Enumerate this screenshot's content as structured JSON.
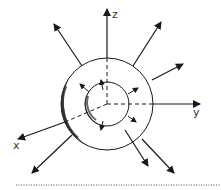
{
  "diagram": {
    "axes": {
      "z_label": "z",
      "x_label": "x",
      "y_label": "y"
    },
    "colors": {
      "stroke": "#1a1a1a",
      "shading": "#2a2a2a",
      "background": "#ffffff",
      "separator": "#555555"
    },
    "center": [
      107,
      104
    ],
    "outer_radius": 46,
    "inner_radius": 22,
    "outer_arrows": [
      {
        "from": [
          82,
          66
        ],
        "to": [
          54,
          24
        ]
      },
      {
        "from": [
          133,
          66
        ],
        "to": [
          161,
          22
        ]
      },
      {
        "from": [
          152,
          80
        ],
        "to": [
          183,
          64
        ]
      },
      {
        "from": [
          72,
          135
        ],
        "to": [
          32,
          173
        ]
      },
      {
        "from": [
          125,
          130
        ],
        "to": [
          148,
          166
        ]
      },
      {
        "from": [
          142,
          139
        ],
        "to": [
          174,
          173
        ]
      }
    ],
    "inner_arrows": [
      {
        "from": [
          89,
          92
        ],
        "to": [
          80,
          84
        ]
      },
      {
        "from": [
          103,
          90
        ],
        "to": [
          101,
          80
        ]
      },
      {
        "from": [
          128,
          94
        ],
        "to": [
          138,
          88
        ]
      },
      {
        "from": [
          128,
          116
        ],
        "to": [
          136,
          122
        ]
      },
      {
        "from": [
          103,
          121
        ],
        "to": [
          101,
          130
        ]
      }
    ]
  }
}
